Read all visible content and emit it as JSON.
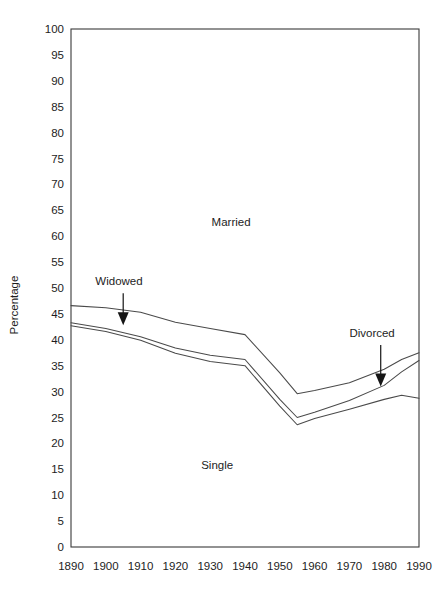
{
  "chart_data": {
    "type": "line",
    "title": "",
    "xlabel": "",
    "ylabel": "Percentage",
    "xlim": [
      1890,
      1990
    ],
    "ylim": [
      0,
      100
    ],
    "grid": false,
    "legend_position": "none",
    "x_ticks": [
      1890,
      1900,
      1910,
      1920,
      1930,
      1940,
      1950,
      1960,
      1970,
      1980,
      1990
    ],
    "y_ticks": [
      0,
      5,
      10,
      15,
      20,
      25,
      30,
      35,
      40,
      45,
      50,
      55,
      60,
      65,
      70,
      75,
      80,
      85,
      90,
      95,
      100
    ],
    "x": [
      1890,
      1900,
      1910,
      1920,
      1930,
      1940,
      1950,
      1955,
      1960,
      1970,
      1980,
      1985,
      1990
    ],
    "series": [
      {
        "name": "upper-boundary",
        "values": [
          46.6,
          46.2,
          45.3,
          43.4,
          42.2,
          41.0,
          33.6,
          29.6,
          30.2,
          31.7,
          34.3,
          36.2,
          37.5
        ]
      },
      {
        "name": "middle-boundary",
        "values": [
          43.3,
          42.2,
          40.6,
          38.4,
          37.0,
          36.2,
          28.5,
          25.0,
          26.0,
          28.3,
          31.2,
          33.8,
          36.0
        ]
      },
      {
        "name": "lower-boundary",
        "values": [
          42.7,
          41.6,
          39.9,
          37.4,
          35.8,
          35.0,
          27.2,
          23.6,
          24.8,
          26.6,
          28.5,
          29.3,
          28.7
        ]
      }
    ],
    "band_labels": [
      {
        "text": "Married",
        "x": 1936,
        "y": 62.0
      },
      {
        "text": "Single",
        "x": 1932,
        "y": 15.0
      }
    ],
    "annotations": [
      {
        "text": "Widowed",
        "label_x": 1897,
        "label_y": 50.5,
        "arrow_from_y": 49.0,
        "arrow_to_y": 42.8,
        "arrow_x": 1905
      },
      {
        "text": "Divorced",
        "label_x": 1970,
        "label_y": 40.5,
        "arrow_from_y": 39.0,
        "arrow_to_y": 31.0,
        "arrow_x": 1979
      }
    ],
    "colors": {
      "line": "#4a4a4a",
      "frame": "#3a3a3a",
      "text": "#1d1d1d",
      "background": "#ffffff"
    }
  }
}
